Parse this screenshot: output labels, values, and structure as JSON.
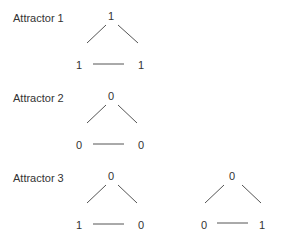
{
  "attractors": [
    {
      "label": "Attractor 1",
      "networks": [
        {
          "top": "1",
          "left": "1",
          "right": "1"
        }
      ]
    },
    {
      "label": "Attractor 2",
      "networks": [
        {
          "top": "0",
          "left": "0",
          "right": "0"
        }
      ]
    },
    {
      "label": "Attractor 3",
      "networks": [
        {
          "top": "0",
          "left": "1",
          "right": "0"
        },
        {
          "top": "0",
          "left": "0",
          "right": "1"
        }
      ]
    }
  ],
  "colors": {
    "text": "#333333",
    "edge": "#555555",
    "background": "#ffffff"
  }
}
